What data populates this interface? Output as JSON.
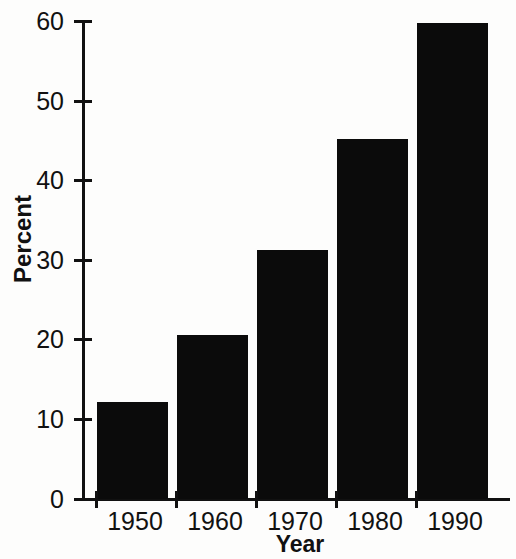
{
  "chart_data": {
    "type": "bar",
    "title": "",
    "subtitle": "",
    "xlabel": "Year",
    "ylabel": "Percent",
    "categories": [
      "1950",
      "1960",
      "1970",
      "1980",
      "1990"
    ],
    "values": [
      12.2,
      20.6,
      31.3,
      45.2,
      59.8
    ],
    "series": [
      {
        "name": "Percent",
        "values": [
          12.2,
          20.6,
          31.3,
          45.2,
          59.8
        ]
      }
    ],
    "ylim": [
      0,
      60
    ],
    "yticks": [
      "0",
      "10",
      "20",
      "30",
      "40",
      "50",
      "60"
    ],
    "ytick_values": [
      0,
      10,
      20,
      30,
      40,
      50,
      60
    ],
    "xticks": [
      "1950",
      "1960",
      "1970",
      "1980",
      "1990"
    ],
    "grid": false,
    "legend": false,
    "legend_position": "none",
    "annotations": [],
    "colors": {
      "bar_fill": "#0b0b0b",
      "axis": "#111111",
      "background": "#fdfdfc",
      "text": "#111111"
    }
  }
}
